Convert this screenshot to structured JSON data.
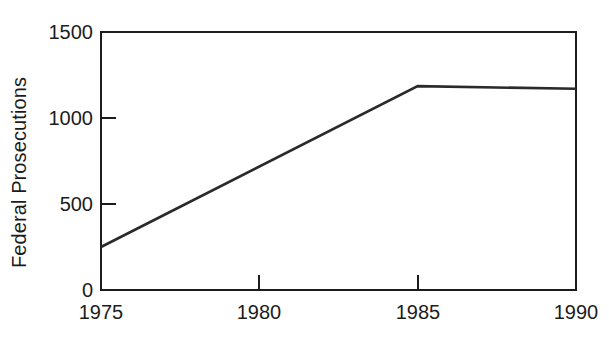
{
  "chart_data": {
    "type": "line",
    "title": "",
    "xlabel": "",
    "ylabel": "Federal Prosecutions",
    "x": [
      1975,
      1985,
      1990
    ],
    "values": [
      250,
      1185,
      1170
    ],
    "series": [
      {
        "name": "Federal Prosecutions",
        "x": [
          1975,
          1985,
          1990
        ],
        "values": [
          250,
          1185,
          1170
        ]
      }
    ],
    "xlim": [
      1975,
      1990
    ],
    "ylim": [
      0,
      1500
    ],
    "xticks": [
      1975,
      1980,
      1985,
      1990
    ],
    "xtick_labels": [
      "1975",
      "1980",
      "1985",
      "1990"
    ],
    "yticks": [
      0,
      500,
      1000,
      1500
    ],
    "ytick_labels": [
      "0",
      "500",
      "1000",
      "1500"
    ],
    "grid": false,
    "legend": null,
    "line_color": "#2a2a2a",
    "axis_color": "#1c1c1c",
    "background": "#ffffff"
  },
  "axes": {
    "y_title": "Federal Prosecutions",
    "y_ticks": [
      {
        "label": "1500",
        "value": 1500
      },
      {
        "label": "1000",
        "value": 1000
      },
      {
        "label": "500",
        "value": 500
      },
      {
        "label": "0",
        "value": 0
      }
    ],
    "x_ticks": [
      {
        "label": "1975",
        "value": 1975
      },
      {
        "label": "1980",
        "value": 1980
      },
      {
        "label": "1985",
        "value": 1985
      },
      {
        "label": "1990",
        "value": 1990
      }
    ]
  }
}
